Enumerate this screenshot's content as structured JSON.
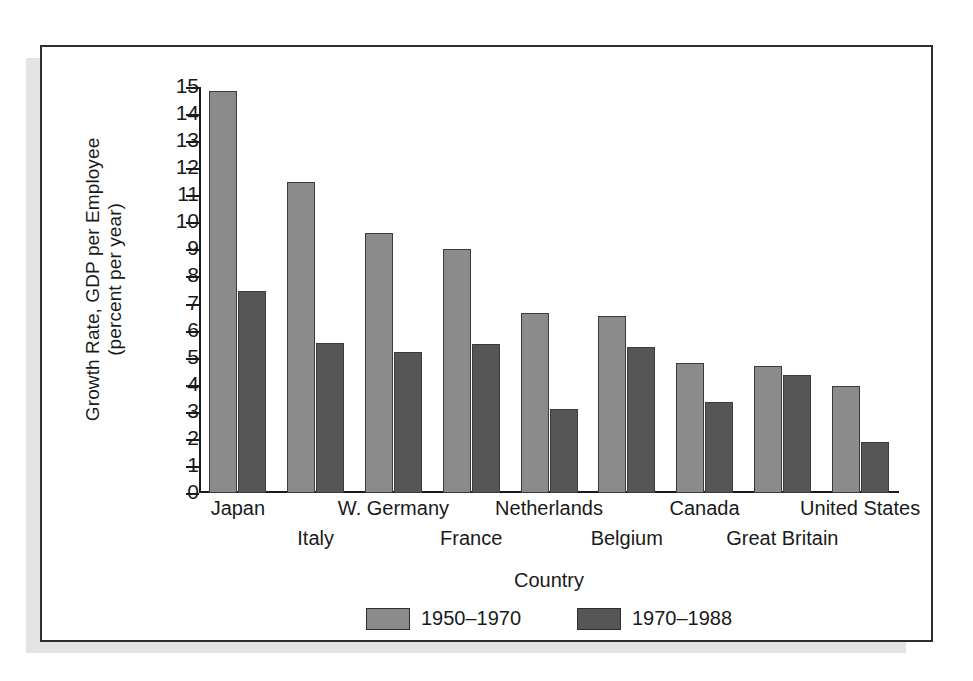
{
  "chart_data": {
    "type": "bar",
    "title": "",
    "xlabel": "Country",
    "ylabel": "Growth Rate, GDP per Employee\n(percent per year)",
    "ylim": [
      0,
      15
    ],
    "yticks": [
      0,
      1,
      2,
      3,
      4,
      5,
      6,
      7,
      8,
      9,
      10,
      11,
      12,
      13,
      14,
      15
    ],
    "ytick_labels": [
      "0",
      "1",
      "2",
      "3",
      "4",
      "5",
      "6",
      "7",
      "8",
      "9",
      "10",
      "11",
      "12",
      "13",
      "14",
      "15"
    ],
    "grid": false,
    "legend_position": "bottom-center",
    "categories": [
      "Japan",
      "Italy",
      "W. Germany",
      "France",
      "Netherlands",
      "Belgium",
      "Canada",
      "Great Britain",
      "United States"
    ],
    "category_rows": [
      "top",
      "bottom",
      "top",
      "bottom",
      "top",
      "bottom",
      "top",
      "bottom",
      "top"
    ],
    "series": [
      {
        "name": "1950-1970",
        "color": "#8b8b8b",
        "values": [
          14.85,
          11.5,
          9.6,
          9.0,
          6.65,
          6.55,
          4.8,
          4.7,
          3.95
        ]
      },
      {
        "name": "1970-1988",
        "color": "#565656",
        "values": [
          7.45,
          5.55,
          5.2,
          5.5,
          3.1,
          5.4,
          3.35,
          4.35,
          1.9
        ]
      }
    ]
  },
  "legend": {
    "items": [
      {
        "label": "1950–1970",
        "series": "a"
      },
      {
        "label": "1970–1988",
        "series": "b"
      }
    ]
  },
  "colors": {
    "series_a": "#8b8b8b",
    "series_b": "#565656",
    "axis": "#1a1a1a",
    "frame": "#2e2e2e",
    "shadow": "#e3e3e3",
    "background": "#ffffff"
  }
}
